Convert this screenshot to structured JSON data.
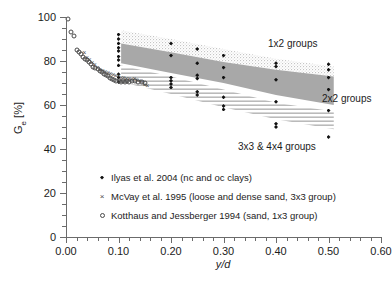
{
  "chart_data": {
    "type": "scatter",
    "title": "",
    "xlabel": "y/d",
    "ylabel": "Ge [%]",
    "ylabel_base": "G",
    "ylabel_sub": "e",
    "ylabel_unit": " [%]",
    "xlim": [
      0.0,
      0.6
    ],
    "ylim": [
      0,
      100
    ],
    "xticks": [
      "0.00",
      "0.10",
      "0.20",
      "0.30",
      "0.40",
      "0.50",
      "0.60"
    ],
    "xtick_values": [
      0.0,
      0.1,
      0.2,
      0.3,
      0.4,
      0.5,
      0.6
    ],
    "yticks": [
      "0",
      "20",
      "40",
      "60",
      "80",
      "100"
    ],
    "ytick_values": [
      0,
      20,
      40,
      60,
      80,
      100
    ],
    "minor_x_step": 0.02,
    "minor_y_step": 5,
    "grid": false,
    "legend_position": "lower-left-inside",
    "series": [
      {
        "name": "Ilyas et al. 2004 (nc and oc clays)",
        "marker": "filled-diamond",
        "color": "#121212",
        "points": [
          [
            0.1,
            92.0
          ],
          [
            0.1,
            90.0
          ],
          [
            0.1,
            88.0
          ],
          [
            0.1,
            86.0
          ],
          [
            0.1,
            84.5
          ],
          [
            0.1,
            82.0
          ],
          [
            0.1,
            80.5
          ],
          [
            0.1,
            78.0
          ],
          [
            0.1,
            74.0
          ],
          [
            0.1,
            72.5
          ],
          [
            0.1,
            70.5
          ],
          [
            0.2,
            88.0
          ],
          [
            0.2,
            82.5
          ],
          [
            0.2,
            72.5
          ],
          [
            0.2,
            71.0
          ],
          [
            0.2,
            69.5
          ],
          [
            0.2,
            68.0
          ],
          [
            0.25,
            85.5
          ],
          [
            0.25,
            79.0
          ],
          [
            0.25,
            73.5
          ],
          [
            0.25,
            72.0
          ],
          [
            0.25,
            66.0
          ],
          [
            0.25,
            64.5
          ],
          [
            0.3,
            82.5
          ],
          [
            0.3,
            77.0
          ],
          [
            0.3,
            72.5
          ],
          [
            0.3,
            63.5
          ],
          [
            0.3,
            59.5
          ],
          [
            0.3,
            58.0
          ],
          [
            0.4,
            79.0
          ],
          [
            0.4,
            77.5
          ],
          [
            0.4,
            71.5
          ],
          [
            0.4,
            61.5
          ],
          [
            0.4,
            51.5
          ],
          [
            0.4,
            50.0
          ],
          [
            0.5,
            78.5
          ],
          [
            0.5,
            76.0
          ],
          [
            0.5,
            72.5
          ],
          [
            0.5,
            67.0
          ],
          [
            0.5,
            57.5
          ],
          [
            0.5,
            45.5
          ]
        ]
      },
      {
        "name": "McVay et al. 1995 (loose and dense sand, 3x3 group)",
        "marker": "cross",
        "color": "#4a4a4a",
        "points": [
          [
            0.035,
            83.5
          ],
          [
            0.04,
            81.5
          ],
          [
            0.045,
            80.5
          ],
          [
            0.05,
            79.0
          ],
          [
            0.055,
            78.0
          ],
          [
            0.06,
            77.0
          ],
          [
            0.065,
            76.0
          ],
          [
            0.07,
            75.5
          ],
          [
            0.075,
            75.0
          ],
          [
            0.08,
            74.5
          ],
          [
            0.085,
            74.0
          ],
          [
            0.09,
            73.5
          ],
          [
            0.095,
            73.0
          ],
          [
            0.1,
            73.0
          ],
          [
            0.105,
            72.5
          ],
          [
            0.11,
            72.5
          ],
          [
            0.115,
            72.0
          ],
          [
            0.12,
            72.0
          ],
          [
            0.125,
            71.5
          ],
          [
            0.13,
            72.0
          ],
          [
            0.135,
            71.5
          ],
          [
            0.14,
            71.0
          ],
          [
            0.145,
            70.5
          ],
          [
            0.15,
            69.0
          ],
          [
            0.155,
            68.5
          ]
        ]
      },
      {
        "name": "Kotthaus and Jessberger 1994 (sand, 1x3 group)",
        "marker": "open-circle",
        "color": "#4a4a4a",
        "points": [
          [
            0.003,
            99.0
          ],
          [
            0.01,
            93.0
          ],
          [
            0.015,
            91.5
          ],
          [
            0.02,
            85.0
          ],
          [
            0.025,
            84.0
          ],
          [
            0.028,
            83.0
          ],
          [
            0.032,
            82.0
          ],
          [
            0.036,
            81.0
          ],
          [
            0.04,
            80.5
          ],
          [
            0.044,
            79.5
          ],
          [
            0.048,
            78.5
          ],
          [
            0.052,
            77.5
          ],
          [
            0.056,
            77.0
          ],
          [
            0.06,
            76.5
          ],
          [
            0.064,
            75.5
          ],
          [
            0.068,
            75.0
          ],
          [
            0.072,
            74.0
          ],
          [
            0.076,
            73.5
          ],
          [
            0.08,
            73.0
          ],
          [
            0.084,
            72.5
          ],
          [
            0.088,
            72.0
          ],
          [
            0.092,
            71.5
          ],
          [
            0.096,
            71.0
          ],
          [
            0.1,
            71.0
          ],
          [
            0.104,
            70.5
          ],
          [
            0.108,
            71.0
          ],
          [
            0.112,
            70.5
          ],
          [
            0.116,
            71.0
          ],
          [
            0.12,
            70.5
          ],
          [
            0.126,
            71.0
          ],
          [
            0.132,
            71.0
          ],
          [
            0.138,
            70.5
          ],
          [
            0.144,
            70.5
          ],
          [
            0.15,
            70.0
          ]
        ]
      }
    ],
    "bands": [
      {
        "name": "1x2 groups",
        "fill": "light-stipple",
        "upper": [
          [
            0.105,
            94.0
          ],
          [
            0.2,
            90.0
          ],
          [
            0.3,
            85.5
          ],
          [
            0.4,
            81.0
          ],
          [
            0.51,
            77.5
          ]
        ],
        "lower": [
          [
            0.105,
            88.0
          ],
          [
            0.2,
            84.0
          ],
          [
            0.3,
            79.5
          ],
          [
            0.4,
            76.0
          ],
          [
            0.51,
            73.0
          ]
        ]
      },
      {
        "name": "2x2 groups",
        "fill": "solid-gray",
        "upper": [
          [
            0.105,
            88.0
          ],
          [
            0.2,
            84.0
          ],
          [
            0.3,
            79.5
          ],
          [
            0.4,
            76.0
          ],
          [
            0.51,
            73.0
          ]
        ],
        "lower": [
          [
            0.105,
            79.0
          ],
          [
            0.2,
            74.5
          ],
          [
            0.3,
            70.0
          ],
          [
            0.4,
            64.5
          ],
          [
            0.51,
            60.0
          ]
        ]
      },
      {
        "name": "3x3 & 4x4 groups",
        "fill": "horizontal-hatch",
        "upper": [
          [
            0.105,
            78.0
          ],
          [
            0.2,
            73.0
          ],
          [
            0.3,
            67.0
          ],
          [
            0.4,
            61.0
          ],
          [
            0.51,
            57.0
          ]
        ],
        "lower": [
          [
            0.105,
            70.5
          ],
          [
            0.2,
            65.0
          ],
          [
            0.3,
            59.0
          ],
          [
            0.4,
            53.5
          ],
          [
            0.51,
            49.0
          ]
        ]
      }
    ],
    "annotations": [
      {
        "text": "1x2 groups",
        "x_px": 268,
        "y_px": 38
      },
      {
        "text": "2x2 groups",
        "x_px": 322,
        "y_px": 93
      },
      {
        "text": "3x3 & 4x4 groups",
        "x_px": 238,
        "y_px": 141
      }
    ],
    "legend": [
      {
        "symbol": "filled-diamond",
        "label": "Ilyas et al. 2004 (nc and oc clays)"
      },
      {
        "symbol": "cross",
        "label": "McVay et al. 1995 (loose and dense sand, 3x3 group)"
      },
      {
        "symbol": "open-circle",
        "label": "Kotthaus and Jessberger 1994 (sand, 1x3 group)"
      }
    ]
  }
}
